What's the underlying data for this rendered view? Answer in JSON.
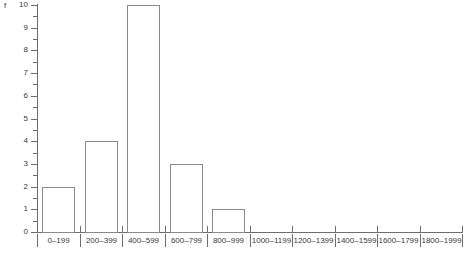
{
  "chart_data": {
    "type": "bar",
    "title": "",
    "xlabel": "",
    "ylabel": "f",
    "categories": [
      "0–199",
      "200–399",
      "400–599",
      "600–799",
      "800–999",
      "1000–1199",
      "1200–1399",
      "1400–1599",
      "1600–1799",
      "1800–1999"
    ],
    "values": [
      2,
      4,
      10,
      3,
      1,
      0,
      0,
      0,
      0,
      0
    ],
    "ylim": [
      0,
      10
    ],
    "y_ticks": [
      0,
      1,
      2,
      3,
      4,
      5,
      6,
      7,
      8,
      9,
      10
    ],
    "y_tick_labels": [
      "0",
      "1",
      "2",
      "3",
      "4",
      "5",
      "6",
      "7",
      "8",
      "9",
      "10"
    ],
    "y_minor_ticks": [
      0.5,
      1.5,
      2.5,
      3.5,
      4.5,
      5.5,
      6.5,
      7.5,
      8.5,
      9.5
    ],
    "grid": false,
    "legend": null,
    "bin_width": 200,
    "colors": {
      "bar_edge": "#8a8a8a",
      "bar_fill": "#ffffff",
      "axis": "#6e6e6e",
      "text": "#3a3a3a",
      "background": "#ffffff"
    }
  }
}
